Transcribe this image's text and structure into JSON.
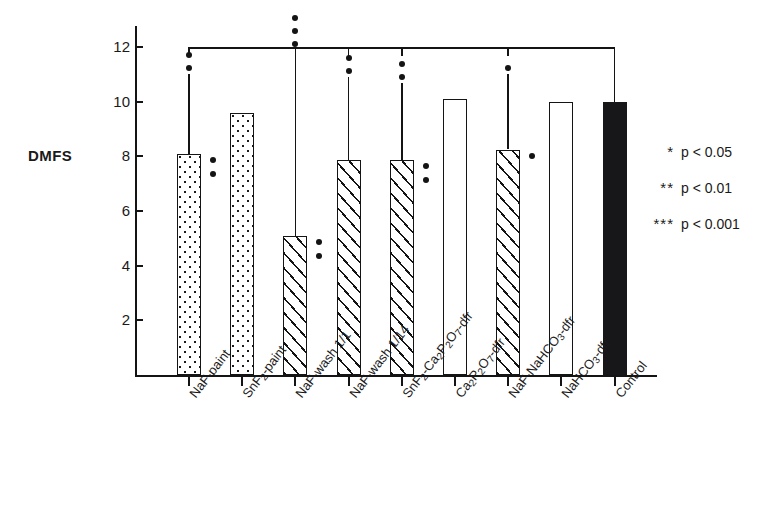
{
  "chart_data": {
    "type": "bar",
    "title": "",
    "xlabel": "",
    "ylabel": "DMFS",
    "ylim": [
      0,
      12.8
    ],
    "yticks": [
      2,
      4,
      6,
      8,
      10,
      12
    ],
    "grid": false,
    "legend_position": "right",
    "categories": [
      "NaF-paint",
      "SnF2-paint",
      "NaF-wash 1/1",
      "NaF-wash 1/14",
      "SnF2-Ca2P2O7-dfr",
      "Ca2P2O7-dfr",
      "NaF-NaHCO3-dfr",
      "NaHCO3-dfr",
      "Control"
    ],
    "values": [
      8.1,
      9.6,
      5.1,
      7.85,
      7.85,
      10.1,
      8.25,
      10.0,
      10.0
    ],
    "error_upper": [
      11.0,
      null,
      11.9,
      10.9,
      10.7,
      null,
      11.0,
      null,
      null
    ],
    "significance_above_bar": [
      "**",
      "",
      "***",
      "**",
      "**",
      "",
      "*",
      "",
      ""
    ],
    "significance_beside_bar": [
      "**",
      "",
      "**",
      "",
      "**",
      "",
      "*",
      "",
      ""
    ],
    "fills": [
      "dotted",
      "dotted",
      "hatched",
      "hatched",
      "hatched",
      "white",
      "hatched",
      "white",
      "black"
    ],
    "annotations": {
      "bracket": "Horizontal comparison bracket at y=12 connecting NaF-paint, NaF-wash 1/1, NaF-wash 1/14, SnF2-Ca2P2O7-dfr and NaF-NaHCO3-dfr to Control"
    }
  },
  "axis": {
    "y_title": "DMFS",
    "y_tick_labels": [
      "12",
      "10",
      "8",
      "6",
      "4",
      "2"
    ]
  },
  "x_labels": [
    {
      "main": "NaF-paint",
      "parts": [
        {
          "t": "NaF-paint"
        }
      ]
    },
    {
      "main": "SnF2-paint",
      "parts": [
        {
          "t": "SnF"
        },
        {
          "t": "2",
          "sub": true
        },
        {
          "t": "-paint"
        }
      ]
    },
    {
      "main": "NaF-wash 1/1",
      "parts": [
        {
          "t": "NaF-wash 1/1"
        }
      ]
    },
    {
      "main": "NaF-wash 1/14",
      "parts": [
        {
          "t": "NaF-wash 1/14"
        }
      ]
    },
    {
      "main": "SnF2-Ca2P2O7-dfr",
      "parts": [
        {
          "t": "SnF"
        },
        {
          "t": "2",
          "sub": true
        },
        {
          "t": "-Ca"
        },
        {
          "t": "2",
          "sub": true
        },
        {
          "t": "P"
        },
        {
          "t": "2",
          "sub": true
        },
        {
          "t": "O"
        },
        {
          "t": "7",
          "sub": true
        },
        {
          "t": "-dfr"
        }
      ]
    },
    {
      "main": "Ca2P2O7-dfr",
      "parts": [
        {
          "t": "Ca"
        },
        {
          "t": "2",
          "sub": true
        },
        {
          "t": "P"
        },
        {
          "t": "2",
          "sub": true
        },
        {
          "t": "O"
        },
        {
          "t": "7",
          "sub": true
        },
        {
          "t": "-dfr"
        }
      ]
    },
    {
      "main": "NaF-NaHCO3-dfr",
      "parts": [
        {
          "t": "NaF-NaHCO"
        },
        {
          "t": "3",
          "sub": true
        },
        {
          "t": "-dfr"
        }
      ]
    },
    {
      "main": "NaHCO3-dfr",
      "parts": [
        {
          "t": "NaHCO"
        },
        {
          "t": "3",
          "sub": true
        },
        {
          "t": "-dfr"
        }
      ]
    },
    {
      "main": "Control",
      "parts": [
        {
          "t": "Control"
        }
      ]
    }
  ],
  "legend": {
    "rows": [
      {
        "stars": "*",
        "text": "p < 0.05"
      },
      {
        "stars": "**",
        "text": "p < 0.01"
      },
      {
        "stars": "***",
        "text": "p < 0.001"
      }
    ]
  },
  "colors": {
    "ink": "#141414",
    "background": "#ffffff",
    "control_bar": "#17171a"
  }
}
